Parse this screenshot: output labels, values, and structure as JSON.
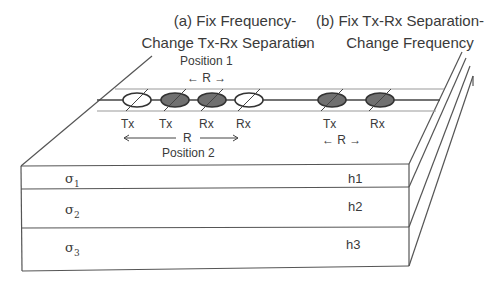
{
  "panel_a": {
    "title_line1": "(a) Fix Frequency-",
    "title_line2": "Change Tx-Rx Separation",
    "position1_label": "Position 1",
    "position1_sep": "← R →",
    "position2_sep_label": "R",
    "position2_label": "Position 2",
    "sensors": [
      {
        "label": "Tx",
        "filled": false
      },
      {
        "label": "Tx",
        "filled": true
      },
      {
        "label": "Rx",
        "filled": true
      },
      {
        "label": "Rx",
        "filled": false
      }
    ]
  },
  "separator_dash": "–",
  "panel_b": {
    "title_line1": "(b) Fix Tx-Rx Separation-",
    "title_line2": "Change Frequency",
    "sep": "← R →",
    "sensors": [
      {
        "label": "Tx",
        "filled": true
      },
      {
        "label": "Rx",
        "filled": true
      }
    ]
  },
  "layers": [
    {
      "sigma": "σ",
      "sub": "1",
      "thickness": "h1"
    },
    {
      "sigma": "σ",
      "sub": "2",
      "thickness": "h2"
    },
    {
      "sigma": "σ",
      "sub": "3",
      "thickness": "h3"
    }
  ],
  "colors": {
    "line": "#555555",
    "filled_sensor": "#707070",
    "text": "#3a3a3a"
  }
}
